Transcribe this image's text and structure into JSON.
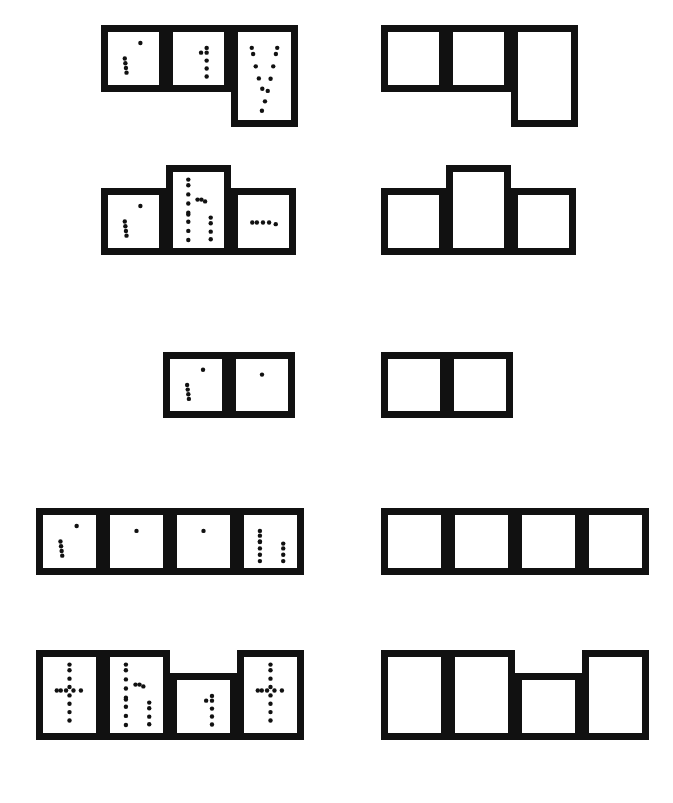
{
  "worksheet": {
    "title": "Sight Word Shape Boxes Tracing Worksheet",
    "ink_color": "#111111",
    "paper_color": "#ffffff",
    "stroke_width_px": 7,
    "dot_radius_px": 2.2,
    "description": "Five sight words shown as dotted tracing letters inside word-shape boxes on the left, with matching empty word-shape boxes on the right.",
    "box_kinds": {
      "square": "x-height letter box",
      "tall": "ascender letter box, extends upward",
      "descender": "descender letter box, extends downward"
    }
  },
  "rows": [
    {
      "word": "say",
      "row_top": 18,
      "letters": [
        {
          "char": "s",
          "kind": "square",
          "x": 101,
          "y": 25,
          "w": 65,
          "h": 67
        },
        {
          "char": "a",
          "kind": "square",
          "x": 166,
          "y": 25,
          "w": 65,
          "h": 67
        },
        {
          "char": "y",
          "kind": "descender",
          "x": 231,
          "y": 25,
          "w": 67,
          "h": 102
        }
      ],
      "empty_letters": [
        {
          "kind": "square",
          "x": 381,
          "y": 25,
          "w": 65,
          "h": 67
        },
        {
          "kind": "square",
          "x": 446,
          "y": 25,
          "w": 65,
          "h": 67
        },
        {
          "kind": "descender",
          "x": 511,
          "y": 25,
          "w": 67,
          "h": 102
        }
      ]
    },
    {
      "word": "she",
      "row_top": 160,
      "letters": [
        {
          "char": "s",
          "kind": "square",
          "x": 101,
          "y": 188,
          "w": 65,
          "h": 67
        },
        {
          "char": "h",
          "kind": "tall",
          "x": 166,
          "y": 165,
          "w": 65,
          "h": 90
        },
        {
          "char": "e",
          "kind": "square",
          "x": 231,
          "y": 188,
          "w": 65,
          "h": 67
        }
      ],
      "empty_letters": [
        {
          "kind": "square",
          "x": 381,
          "y": 188,
          "w": 65,
          "h": 67
        },
        {
          "kind": "tall",
          "x": 446,
          "y": 165,
          "w": 65,
          "h": 90
        },
        {
          "kind": "square",
          "x": 511,
          "y": 188,
          "w": 65,
          "h": 67
        }
      ]
    },
    {
      "word": "so",
      "row_top": 350,
      "letters": [
        {
          "char": "s",
          "kind": "square",
          "x": 163,
          "y": 352,
          "w": 66,
          "h": 66
        },
        {
          "char": "o",
          "kind": "square",
          "x": 229,
          "y": 352,
          "w": 66,
          "h": 66
        }
      ],
      "empty_letters": [
        {
          "kind": "square",
          "x": 381,
          "y": 352,
          "w": 66,
          "h": 66
        },
        {
          "kind": "square",
          "x": 447,
          "y": 352,
          "w": 66,
          "h": 66
        }
      ]
    },
    {
      "word": "soon",
      "row_top": 500,
      "letters": [
        {
          "char": "s",
          "kind": "square",
          "x": 36,
          "y": 508,
          "w": 67,
          "h": 67
        },
        {
          "char": "o",
          "kind": "square",
          "x": 103,
          "y": 508,
          "w": 67,
          "h": 67
        },
        {
          "char": "o",
          "kind": "square",
          "x": 170,
          "y": 508,
          "w": 67,
          "h": 67
        },
        {
          "char": "n",
          "kind": "square",
          "x": 237,
          "y": 508,
          "w": 67,
          "h": 67
        }
      ],
      "empty_letters": [
        {
          "kind": "square",
          "x": 381,
          "y": 508,
          "w": 67,
          "h": 67
        },
        {
          "kind": "square",
          "x": 448,
          "y": 508,
          "w": 67,
          "h": 67
        },
        {
          "kind": "square",
          "x": 515,
          "y": 508,
          "w": 67,
          "h": 67
        },
        {
          "kind": "square",
          "x": 582,
          "y": 508,
          "w": 67,
          "h": 67
        }
      ]
    },
    {
      "word": "that",
      "row_top": 640,
      "letters": [
        {
          "char": "t",
          "kind": "tall",
          "x": 36,
          "y": 650,
          "w": 67,
          "h": 90
        },
        {
          "char": "h",
          "kind": "tall",
          "x": 103,
          "y": 650,
          "w": 67,
          "h": 90
        },
        {
          "char": "a",
          "kind": "square",
          "x": 170,
          "y": 673,
          "w": 67,
          "h": 67
        },
        {
          "char": "t",
          "kind": "tall",
          "x": 237,
          "y": 650,
          "w": 67,
          "h": 90
        }
      ],
      "empty_letters": [
        {
          "kind": "tall",
          "x": 381,
          "y": 650,
          "w": 67,
          "h": 90
        },
        {
          "kind": "tall",
          "x": 448,
          "y": 650,
          "w": 67,
          "h": 90
        },
        {
          "kind": "square",
          "x": 515,
          "y": 673,
          "w": 67,
          "h": 67
        },
        {
          "kind": "tall",
          "x": 582,
          "y": 650,
          "w": 67,
          "h": 90
        }
      ]
    }
  ]
}
